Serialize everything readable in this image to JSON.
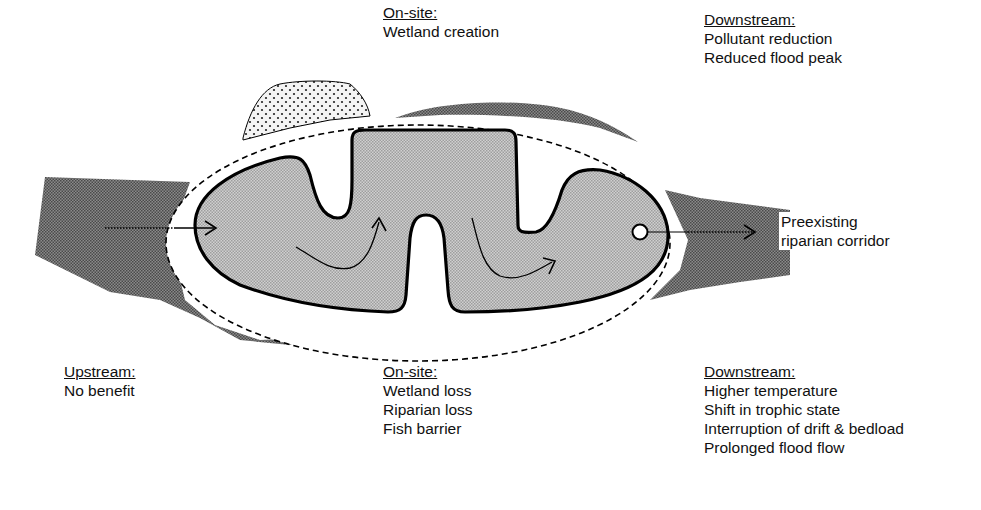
{
  "diagram": {
    "colors": {
      "corridor_fill": "#6e6e6e",
      "wetland_fill": "#bdbdbd",
      "outline": "#000000",
      "background": "#ffffff"
    },
    "shapes": [
      {
        "name": "riparian-corridor",
        "description": "dark gray band upstream and downstream"
      },
      {
        "name": "impoundment-boundary",
        "description": "dashed ellipse"
      },
      {
        "name": "wetland-area",
        "description": "light gray lobed area with thick outline"
      },
      {
        "name": "upland-fill",
        "description": "dotted mound at top"
      },
      {
        "name": "outlet",
        "description": "small circle at downstream end"
      }
    ]
  },
  "labels": {
    "onsite_top": {
      "heading": "On-site:",
      "items": [
        "Wetland creation"
      ]
    },
    "downstream_top": {
      "heading": "Downstream:",
      "items": [
        "Pollutant reduction",
        "Reduced flood peak"
      ]
    },
    "corridor": {
      "items": [
        "Preexisting",
        "riparian corridor"
      ]
    },
    "upstream": {
      "heading": "Upstream:",
      "items": [
        "No benefit"
      ]
    },
    "onsite_bottom": {
      "heading": "On-site:",
      "items": [
        "Wetland loss",
        "Riparian loss",
        "Fish barrier"
      ]
    },
    "downstream_bottom": {
      "heading": "Downstream:",
      "items": [
        "Higher temperature",
        "Shift in trophic state",
        "Interruption of drift & bedload",
        "Prolonged flood flow"
      ]
    }
  }
}
